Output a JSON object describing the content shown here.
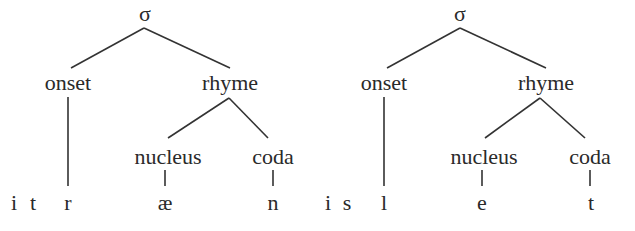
{
  "trees": [
    {
      "root": "σ",
      "onset": "onset",
      "rhyme": "rhyme",
      "nucleus": "nucleus",
      "coda": "coda",
      "segments": {
        "pre1": "i",
        "pre2": "t",
        "onset": "r",
        "nucleus": "æ",
        "coda": "n"
      }
    },
    {
      "root": "σ",
      "onset": "onset",
      "rhyme": "rhyme",
      "nucleus": "nucleus",
      "coda": "coda",
      "segments": {
        "pre1": "i",
        "pre2": "s",
        "onset": "l",
        "nucleus": "e",
        "coda": "t"
      }
    }
  ]
}
